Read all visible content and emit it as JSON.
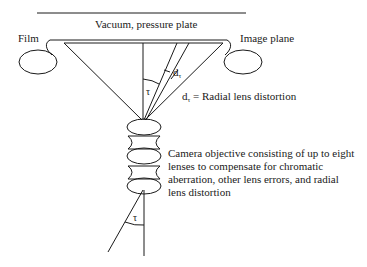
{
  "diagram": {
    "labels": {
      "top_plate": "Vacuum, pressure plate",
      "film": "Film",
      "image_plane": "Image plane",
      "tau_symbol": "τ",
      "dr_symbol": "d",
      "dr_subscript": "τ",
      "dr_definition_symbol": "d",
      "dr_definition_subscript": "τ",
      "dr_definition_text": " = Radial lens distortion"
    },
    "description_lines": [
      "Camera objective consisting of up to eight",
      "lenses to compensate for chromatic",
      "aberration, other lens errors, and radial",
      "lens distortion"
    ],
    "colors": {
      "stroke": "#1a1a1a",
      "background": "#ffffff"
    }
  }
}
